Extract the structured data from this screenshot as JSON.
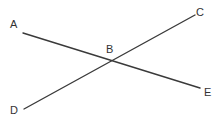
{
  "diagram": {
    "type": "intersecting-lines",
    "line_color": "#3a3a3a",
    "label_color": "#333333",
    "points": [
      {
        "id": "A",
        "label": "A",
        "x": 23,
        "y": 33,
        "label_x": 10,
        "label_y": 28
      },
      {
        "id": "B",
        "label": "B",
        "x": 113,
        "y": 60,
        "label_x": 106,
        "label_y": 53
      },
      {
        "id": "C",
        "label": "C",
        "x": 195,
        "y": 15,
        "label_x": 196,
        "label_y": 16
      },
      {
        "id": "D",
        "label": "D",
        "x": 24,
        "y": 109,
        "label_x": 10,
        "label_y": 114
      },
      {
        "id": "E",
        "label": "E",
        "x": 200,
        "y": 88,
        "label_x": 204,
        "label_y": 96
      }
    ],
    "segments": [
      {
        "id": "AE",
        "from": "A",
        "to": "E"
      },
      {
        "id": "DC",
        "from": "D",
        "to": "C"
      }
    ]
  }
}
